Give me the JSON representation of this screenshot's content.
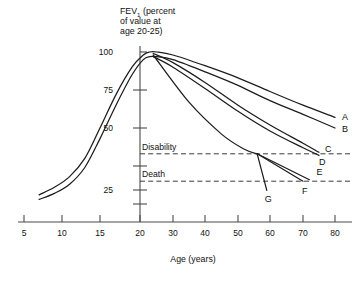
{
  "chart_data": {
    "type": "line",
    "title": "",
    "ylabel": "FEV₁ (percent of value at age 20-25)",
    "ylabel_lines": [
      "FEV",
      "1",
      " (percent",
      "of value at",
      "age 20-25)"
    ],
    "xlabel": "Age (years)",
    "xticks": [
      5,
      10,
      15,
      20,
      30,
      40,
      50,
      60,
      70,
      80
    ],
    "xtick_labels": [
      "5",
      "10",
      "15",
      "20",
      "30",
      "40",
      "50",
      "60",
      "70",
      "80"
    ],
    "xaxis_note": "non-linear: 5-20 compressed, 20-80 linear",
    "yticks": [
      25,
      50,
      75,
      100
    ],
    "ytick_labels": [
      "25",
      "50",
      "75",
      "100"
    ],
    "ylim": [
      0,
      108
    ],
    "grid": false,
    "legend": "none",
    "thresholds": [
      {
        "name": "Disability",
        "label": "Disability",
        "value": 33
      },
      {
        "name": "Death",
        "label": "Death",
        "value": 15
      }
    ],
    "annotations": [
      {
        "label": "A",
        "x": 80,
        "y": 57,
        "note": "never smoked / not susceptible, upper curve"
      },
      {
        "label": "B",
        "x": 80,
        "y": 50,
        "note": "never smoked / not susceptible, lower curve"
      },
      {
        "label": "C",
        "x": 75,
        "y": 34,
        "note": "smoked regularly and susceptible, upper"
      },
      {
        "label": "D",
        "x": 75,
        "y": 32,
        "note": "smoked regularly and susceptible, lower"
      },
      {
        "label": "E",
        "x": 72,
        "y": 20,
        "note": "stopped at 45 upper branch"
      },
      {
        "label": "F",
        "x": 70,
        "y": 14,
        "note": "stopped at 45 lower branch"
      },
      {
        "label": "G",
        "x": 59,
        "y": 9,
        "note": "disability/death endpoint of steepest decline"
      }
    ],
    "series": [
      {
        "name": "A",
        "label": "A",
        "points": [
          [
            7,
            6
          ],
          [
            9,
            11
          ],
          [
            11,
            18
          ],
          [
            13,
            30
          ],
          [
            15,
            50
          ],
          [
            17,
            72
          ],
          [
            19,
            90
          ],
          [
            21,
            98
          ],
          [
            23,
            100
          ],
          [
            25,
            100
          ],
          [
            30,
            98
          ],
          [
            40,
            91
          ],
          [
            50,
            83
          ],
          [
            60,
            74
          ],
          [
            70,
            65
          ],
          [
            80,
            57
          ]
        ]
      },
      {
        "name": "B",
        "label": "B",
        "points": [
          [
            7,
            3
          ],
          [
            9,
            7
          ],
          [
            11,
            13
          ],
          [
            13,
            24
          ],
          [
            15,
            43
          ],
          [
            17,
            65
          ],
          [
            19,
            85
          ],
          [
            21,
            95
          ],
          [
            23,
            97
          ],
          [
            25,
            97
          ],
          [
            30,
            95
          ],
          [
            40,
            87
          ],
          [
            50,
            78
          ],
          [
            60,
            68
          ],
          [
            70,
            59
          ],
          [
            80,
            50
          ]
        ]
      },
      {
        "name": "C",
        "label": "C",
        "points": [
          [
            24,
            99
          ],
          [
            30,
            93
          ],
          [
            40,
            80
          ],
          [
            50,
            65
          ],
          [
            60,
            52
          ],
          [
            70,
            40
          ],
          [
            75,
            34
          ]
        ]
      },
      {
        "name": "D",
        "label": "D",
        "points": [
          [
            24,
            97
          ],
          [
            30,
            90
          ],
          [
            40,
            76
          ],
          [
            50,
            61
          ],
          [
            60,
            48
          ],
          [
            70,
            37
          ],
          [
            75,
            32
          ]
        ]
      },
      {
        "name": "steep-decline",
        "label": "G",
        "points": [
          [
            24,
            98
          ],
          [
            35,
            67
          ],
          [
            45,
            46
          ],
          [
            52,
            36
          ],
          [
            56,
            33
          ]
        ]
      },
      {
        "name": "G-branch",
        "label": "G",
        "points": [
          [
            56,
            33
          ],
          [
            59,
            9
          ]
        ]
      },
      {
        "name": "E-branch",
        "label": "E",
        "points": [
          [
            56,
            33
          ],
          [
            72,
            16
          ]
        ]
      },
      {
        "name": "F-branch",
        "label": "F",
        "points": [
          [
            56,
            33
          ],
          [
            70,
            15
          ]
        ]
      }
    ]
  }
}
